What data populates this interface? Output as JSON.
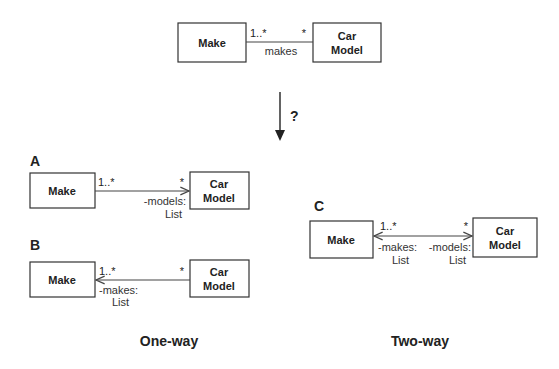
{
  "top": {
    "left_class": "Make",
    "right_class_line1": "Car",
    "right_class_line2": "Model",
    "left_multiplicity": "1..*",
    "right_multiplicity": "*",
    "association_label": "makes"
  },
  "transition": {
    "question": "?"
  },
  "options": [
    {
      "label": "A",
      "left_class": "Make",
      "right_class_line1": "Car",
      "right_class_line2": "Model",
      "left_multiplicity": "1..*",
      "right_multiplicity": "*",
      "navigability": "Make → Car Model",
      "right_role_line1": "-models:",
      "right_role_line2": "List"
    },
    {
      "label": "B",
      "left_class": "Make",
      "right_class_line1": "Car",
      "right_class_line2": "Model",
      "left_multiplicity": "1..*",
      "right_multiplicity": "*",
      "navigability": "Car Model → Make",
      "left_role_line1": "-makes:",
      "left_role_line2": "List"
    },
    {
      "label": "C",
      "left_class": "Make",
      "right_class_line1": "Car",
      "right_class_line2": "Model",
      "left_multiplicity": "1..*",
      "right_multiplicity": "*",
      "navigability": "bidirectional",
      "left_role_line1": "-makes:",
      "left_role_line2": "List",
      "right_role_line1": "-models:",
      "right_role_line2": "List"
    }
  ],
  "captions": {
    "one_way": "One-way",
    "two_way": "Two-way"
  }
}
